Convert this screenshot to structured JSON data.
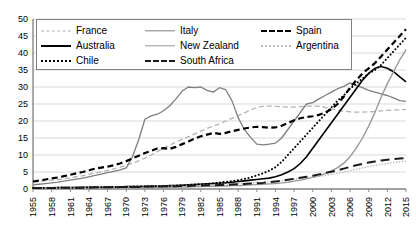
{
  "chart_data": {
    "type": "line",
    "title": "",
    "xlabel": "",
    "ylabel": "",
    "xlim": [
      1955,
      2015
    ],
    "ylim": [
      0,
      50
    ],
    "yticks": [
      0,
      5,
      10,
      15,
      20,
      25,
      30,
      35,
      40,
      45,
      50
    ],
    "xticks": [
      1955,
      1958,
      1961,
      1964,
      1967,
      1970,
      1973,
      1976,
      1979,
      1982,
      1985,
      1988,
      1991,
      1994,
      1997,
      2000,
      2003,
      2006,
      2009,
      2012,
      2015
    ],
    "xtick_labels": [
      "1955",
      "1958",
      "1961",
      "1964",
      "1967",
      "1970",
      "1973",
      "1976",
      "1979",
      "1982",
      "1985",
      "1988",
      "1991",
      "1994",
      "1997",
      "2000",
      "2003",
      "2006",
      "2009",
      "2012",
      "2015"
    ],
    "grid": "horizontal",
    "legend_position": "top-left-inside",
    "x": [
      1955,
      1956,
      1957,
      1958,
      1959,
      1960,
      1961,
      1962,
      1963,
      1964,
      1965,
      1966,
      1967,
      1968,
      1969,
      1970,
      1971,
      1972,
      1973,
      1974,
      1975,
      1976,
      1977,
      1978,
      1979,
      1980,
      1981,
      1982,
      1983,
      1984,
      1985,
      1986,
      1987,
      1988,
      1989,
      1990,
      1991,
      1992,
      1993,
      1994,
      1995,
      1996,
      1997,
      1998,
      1999,
      2000,
      2001,
      2002,
      2003,
      2004,
      2005,
      2006,
      2007,
      2008,
      2009,
      2010,
      2011,
      2012,
      2013,
      2014,
      2015
    ],
    "series": [
      {
        "name": "France",
        "style": "dashed",
        "color": "#b3b3b3",
        "width": 1.3,
        "values": [
          2.0,
          2.2,
          2.4,
          2.6,
          2.8,
          3.0,
          3.3,
          3.6,
          3.9,
          4.3,
          4.7,
          5.1,
          5.5,
          5.9,
          6.4,
          7.0,
          7.6,
          8.3,
          9.1,
          10.0,
          11.0,
          12.0,
          12.9,
          13.8,
          14.6,
          15.4,
          16.2,
          17.0,
          17.8,
          18.5,
          19.2,
          20.0,
          20.8,
          21.6,
          22.4,
          23.2,
          24.0,
          24.3,
          24.4,
          24.3,
          24.2,
          24.1,
          24.1,
          24.2,
          24.3,
          24.5,
          24.3,
          24.0,
          23.6,
          23.2,
          22.9,
          22.7,
          22.6,
          22.6,
          22.7,
          22.8,
          23.0,
          23.1,
          23.2,
          23.3,
          23.4
        ]
      },
      {
        "name": "Italy",
        "style": "solid",
        "color": "#7f7f7f",
        "width": 1.3,
        "values": [
          1.2,
          1.4,
          1.6,
          1.8,
          2.0,
          2.3,
          2.6,
          2.9,
          3.2,
          3.6,
          4.0,
          4.4,
          4.8,
          5.2,
          5.6,
          6.2,
          9.5,
          14.5,
          20.5,
          21.5,
          22.0,
          23.0,
          24.5,
          26.5,
          28.8,
          30.0,
          29.8,
          30.0,
          29.0,
          28.5,
          29.8,
          29.2,
          26.0,
          21.0,
          17.5,
          15.2,
          13.2,
          13.0,
          13.2,
          13.5,
          15.0,
          17.5,
          20.0,
          22.5,
          25.0,
          25.4,
          26.5,
          27.5,
          28.5,
          29.5,
          30.2,
          31.2,
          30.5,
          29.8,
          29.0,
          28.5,
          28.0,
          27.5,
          26.8,
          26.0,
          25.8
        ]
      },
      {
        "name": "Spain",
        "style": "dashed-bold",
        "color": "#000000",
        "width": 2.2,
        "values": [
          2.2,
          2.5,
          2.8,
          3.1,
          3.4,
          3.8,
          4.2,
          4.6,
          5.0,
          5.5,
          6.0,
          6.3,
          6.6,
          7.0,
          7.5,
          8.2,
          9.0,
          9.8,
          10.6,
          11.2,
          11.9,
          12.0,
          11.8,
          12.4,
          13.2,
          14.0,
          14.8,
          15.5,
          16.0,
          16.5,
          16.2,
          16.5,
          17.0,
          17.4,
          17.8,
          18.1,
          18.3,
          18.2,
          18.0,
          18.1,
          18.6,
          19.4,
          20.2,
          20.8,
          21.2,
          21.4,
          21.8,
          22.5,
          23.5,
          25.0,
          27.2,
          29.8,
          32.0,
          34.0,
          35.5,
          37.0,
          39.0,
          41.0,
          43.0,
          45.0,
          47.0
        ]
      },
      {
        "name": "Australia",
        "style": "solid",
        "color": "#000000",
        "width": 1.6,
        "values": [
          0.3,
          0.3,
          0.3,
          0.3,
          0.4,
          0.4,
          0.4,
          0.4,
          0.5,
          0.5,
          0.5,
          0.5,
          0.6,
          0.6,
          0.6,
          0.7,
          0.7,
          0.7,
          0.8,
          0.8,
          0.9,
          0.9,
          1.0,
          1.0,
          1.1,
          1.2,
          1.3,
          1.4,
          1.5,
          1.6,
          1.7,
          1.8,
          2.0,
          2.2,
          2.4,
          2.6,
          2.8,
          3.0,
          3.2,
          3.6,
          4.2,
          5.0,
          6.0,
          7.5,
          9.5,
          12.0,
          14.5,
          17.0,
          19.5,
          22.0,
          24.5,
          27.0,
          29.5,
          32.0,
          34.0,
          35.5,
          36.0,
          35.5,
          34.5,
          33.0,
          31.5
        ]
      },
      {
        "name": "New Zealand",
        "style": "solid",
        "color": "#9a9a9a",
        "width": 1.4,
        "values": [
          0.2,
          0.2,
          0.2,
          0.2,
          0.2,
          0.2,
          0.2,
          0.2,
          0.3,
          0.3,
          0.3,
          0.3,
          0.3,
          0.3,
          0.4,
          0.4,
          0.4,
          0.4,
          0.4,
          0.5,
          0.5,
          0.5,
          0.5,
          0.6,
          0.6,
          0.6,
          0.7,
          0.7,
          0.8,
          0.8,
          0.9,
          0.9,
          1.0,
          1.0,
          1.1,
          1.2,
          1.3,
          1.4,
          1.5,
          1.6,
          1.8,
          2.0,
          2.3,
          2.6,
          3.0,
          3.4,
          3.9,
          4.5,
          5.3,
          6.3,
          7.6,
          9.5,
          12.0,
          15.0,
          18.5,
          22.5,
          27.0,
          31.0,
          34.5,
          38.0,
          41.0
        ]
      },
      {
        "name": "Argentina",
        "style": "dotted",
        "color": "#bdbdbd",
        "width": 1.6,
        "values": [
          0.4,
          0.4,
          0.4,
          0.5,
          0.5,
          0.5,
          0.5,
          0.6,
          0.6,
          0.6,
          0.6,
          0.7,
          0.7,
          0.7,
          0.7,
          0.8,
          0.8,
          0.8,
          0.9,
          0.9,
          0.9,
          1.0,
          1.0,
          1.0,
          1.1,
          1.1,
          1.2,
          1.2,
          1.3,
          1.3,
          1.4,
          1.4,
          1.5,
          1.6,
          1.7,
          1.8,
          1.9,
          2.0,
          2.1,
          2.3,
          2.5,
          2.7,
          2.9,
          3.1,
          3.3,
          3.5,
          3.7,
          4.0,
          4.3,
          4.6,
          5.0,
          5.4,
          5.8,
          6.2,
          6.6,
          6.9,
          7.2,
          7.5,
          7.8,
          8.0,
          8.2
        ]
      },
      {
        "name": "Chile",
        "style": "dotted",
        "color": "#000000",
        "width": 2.0,
        "values": [
          0.3,
          0.3,
          0.3,
          0.3,
          0.4,
          0.4,
          0.4,
          0.4,
          0.4,
          0.5,
          0.5,
          0.5,
          0.5,
          0.6,
          0.6,
          0.6,
          0.7,
          0.7,
          0.7,
          0.8,
          0.8,
          0.9,
          0.9,
          1.0,
          1.1,
          1.2,
          1.3,
          1.4,
          1.5,
          1.7,
          1.9,
          2.1,
          2.3,
          2.6,
          3.0,
          3.4,
          4.0,
          4.6,
          5.4,
          6.4,
          8.0,
          10.0,
          12.0,
          14.0,
          16.0,
          18.0,
          20.0,
          22.0,
          24.0,
          26.0,
          27.5,
          29.5,
          31.0,
          32.5,
          34.0,
          35.0,
          36.5,
          38.5,
          40.5,
          42.5,
          44.5
        ]
      },
      {
        "name": "South Africa",
        "style": "dashed-long",
        "color": "#1a1a1a",
        "width": 2.0,
        "values": [
          0.3,
          0.3,
          0.3,
          0.3,
          0.3,
          0.4,
          0.4,
          0.4,
          0.4,
          0.4,
          0.5,
          0.5,
          0.5,
          0.5,
          0.6,
          0.6,
          0.6,
          0.6,
          0.7,
          0.7,
          0.7,
          0.8,
          0.8,
          0.8,
          0.9,
          0.9,
          1.0,
          1.0,
          1.1,
          1.1,
          1.2,
          1.2,
          1.3,
          1.4,
          1.5,
          1.6,
          1.7,
          1.8,
          2.0,
          2.2,
          2.4,
          2.7,
          3.0,
          3.3,
          3.6,
          3.9,
          4.3,
          4.7,
          5.1,
          5.5,
          6.0,
          6.5,
          7.0,
          7.4,
          7.8,
          8.1,
          8.4,
          8.6,
          8.8,
          9.0,
          9.1
        ]
      }
    ]
  },
  "legend": {
    "items": [
      {
        "label": "France",
        "style": "dashed",
        "color": "#b3b3b3"
      },
      {
        "label": "Italy",
        "style": "solid",
        "color": "#7f7f7f"
      },
      {
        "label": "Spain",
        "style": "dashed-bold",
        "color": "#000000"
      },
      {
        "label": "Australia",
        "style": "solid",
        "color": "#000000"
      },
      {
        "label": "New Zealand",
        "style": "solid",
        "color": "#9a9a9a"
      },
      {
        "label": "Argentina",
        "style": "dotted",
        "color": "#bdbdbd"
      },
      {
        "label": "Chile",
        "style": "dotted",
        "color": "#000000"
      },
      {
        "label": "South Africa",
        "style": "dashed-long",
        "color": "#1a1a1a"
      }
    ]
  },
  "axes": {
    "grid_color": "#d9d9d9",
    "axis_color": "#808080"
  }
}
